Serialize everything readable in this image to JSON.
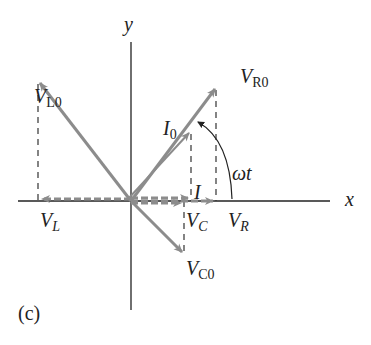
{
  "figure": {
    "panel_label": "(c)",
    "axes": {
      "x_label": "x",
      "y_label": "y"
    },
    "angle_label": "ωt",
    "phasors": [
      {
        "name": "V_R0",
        "main": "V",
        "sub": "R0",
        "kind": "voltage-resistor-amplitude"
      },
      {
        "name": "V_L0",
        "main": "V",
        "sub": "L0",
        "kind": "voltage-inductor-amplitude"
      },
      {
        "name": "V_C0",
        "main": "V",
        "sub": "C0",
        "kind": "voltage-capacitor-amplitude"
      },
      {
        "name": "I_0",
        "main": "I",
        "sub": "0",
        "kind": "current-amplitude"
      }
    ],
    "projections": [
      {
        "name": "V_R",
        "main": "V",
        "sub": "R"
      },
      {
        "name": "V_L",
        "main": "V",
        "sub": "L"
      },
      {
        "name": "V_C",
        "main": "V",
        "sub": "C"
      },
      {
        "name": "I",
        "main": "I",
        "sub": ""
      }
    ],
    "colors": {
      "phasor": "#8c8c8c",
      "axis": "#222222",
      "dashed": "#333333",
      "background": "#ffffff"
    }
  }
}
